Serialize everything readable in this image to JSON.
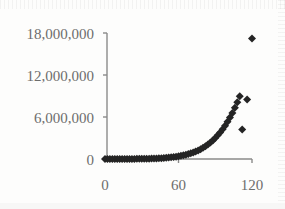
{
  "chart_data": {
    "type": "scatter",
    "title": "",
    "xlabel": "",
    "ylabel": "",
    "xlim": [
      -4,
      124
    ],
    "ylim": [
      0,
      18600000
    ],
    "grid": false,
    "legend": null,
    "marker": {
      "shape": "diamond",
      "color": "#242424",
      "size_px": 7
    },
    "y_ticks": [
      0,
      6000000,
      12000000,
      18000000
    ],
    "y_tick_labels": [
      "0",
      "6,000,000",
      "12,000,000",
      "18,000,000"
    ],
    "x_ticks": [
      0,
      60,
      120
    ],
    "x_tick_labels": [
      "0",
      "60",
      "120"
    ],
    "series": [
      {
        "name": "series-1",
        "x": [
          0,
          2,
          4,
          6,
          8,
          10,
          12,
          14,
          16,
          18,
          20,
          22,
          24,
          26,
          28,
          30,
          32,
          34,
          36,
          38,
          40,
          42,
          44,
          46,
          48,
          50,
          52,
          54,
          56,
          58,
          60,
          62,
          64,
          66,
          68,
          70,
          72,
          74,
          76,
          78,
          80,
          82,
          84,
          86,
          88,
          90,
          92,
          94,
          96,
          98,
          100,
          102,
          104,
          106,
          108,
          110,
          112,
          116,
          120
        ],
        "y": [
          1000,
          1500,
          2000,
          2600,
          3200,
          4000,
          5000,
          6200,
          7600,
          9400,
          11500,
          14000,
          17000,
          21000,
          25000,
          30000,
          36000,
          43000,
          52000,
          62000,
          74000,
          88000,
          105000,
          125000,
          148000,
          175000,
          205000,
          242000,
          284000,
          332000,
          388000,
          452000,
          525000,
          609000,
          704000,
          812000,
          935000,
          1074000,
          1231000,
          1408000,
          1606000,
          1828000,
          2076000,
          2352000,
          2659000,
          3000000,
          3377000,
          3793000,
          4252000,
          4757000,
          5311000,
          5918000,
          6583000,
          7310000,
          8103000,
          8967000,
          4200000,
          8500000,
          17200000
        ]
      }
    ]
  },
  "colors": {
    "background": "#fdfdfc",
    "marker": "#242424",
    "axis": "#8a8a8a",
    "tick_text": "#6d6d6d"
  }
}
